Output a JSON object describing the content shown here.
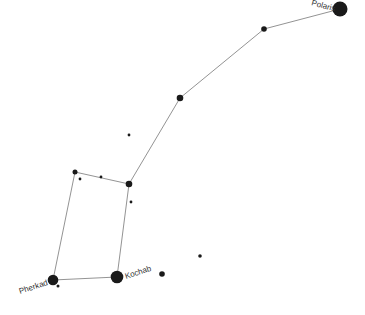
{
  "colors": {
    "star": "#1a1a1a",
    "line": "#777777",
    "label": "#333333",
    "background": "#ffffff"
  },
  "labels": {
    "polaris": "Polaris",
    "kochab": "Kochab",
    "pherkad": "Pherkad"
  },
  "stars": [
    {
      "name": "Polaris",
      "x": 340,
      "y": 9,
      "r": 7.5
    },
    {
      "name": "",
      "x": 264,
      "y": 29,
      "r": 2.8
    },
    {
      "name": "",
      "x": 180,
      "y": 98,
      "r": 3.3
    },
    {
      "name": "",
      "x": 129,
      "y": 135,
      "r": 1.4
    },
    {
      "name": "",
      "x": 75,
      "y": 172,
      "r": 2.5
    },
    {
      "name": "",
      "x": 80,
      "y": 179,
      "r": 1.4
    },
    {
      "name": "",
      "x": 101,
      "y": 177,
      "r": 1.4
    },
    {
      "name": "",
      "x": 129,
      "y": 184,
      "r": 3.3
    },
    {
      "name": "",
      "x": 131,
      "y": 202,
      "r": 1.4
    },
    {
      "name": "",
      "x": 200,
      "y": 256,
      "r": 1.8
    },
    {
      "name": "",
      "x": 162,
      "y": 274,
      "r": 2.8
    },
    {
      "name": "Kochab",
      "x": 117,
      "y": 277,
      "r": 6.3
    },
    {
      "name": "Pherkad",
      "x": 53,
      "y": 280,
      "r": 5.3
    },
    {
      "name": "",
      "x": 58,
      "y": 286,
      "r": 1.5
    }
  ],
  "lines": [
    [
      340,
      9,
      264,
      29
    ],
    [
      264,
      29,
      180,
      98
    ],
    [
      180,
      98,
      129,
      184
    ],
    [
      129,
      184,
      75,
      172
    ],
    [
      75,
      172,
      53,
      280
    ],
    [
      53,
      280,
      117,
      277
    ],
    [
      117,
      277,
      129,
      184
    ]
  ]
}
